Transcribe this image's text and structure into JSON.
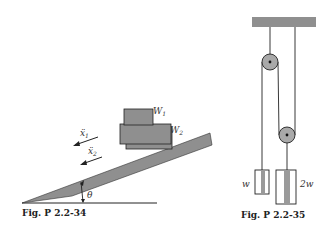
{
  "figures": [
    {
      "id": "fig-left",
      "caption": "Fig. P 2.2-34",
      "labels": {
        "block_top": "W",
        "block_top_sub": "1",
        "block_bottom": "W",
        "block_bottom_sub": "2",
        "accel_1": "ẍ",
        "accel_1_sub": "1",
        "accel_2": "ẍ",
        "accel_2_sub": "2",
        "angle": "θ"
      }
    },
    {
      "id": "fig-right",
      "caption": "Fig. P 2.2-35",
      "labels": {
        "mass_left": "w",
        "mass_right": "2w"
      }
    }
  ],
  "colors": {
    "fill_gray": "#8f8f8f",
    "line": "#222222",
    "pulley": "#a9a9a9"
  }
}
